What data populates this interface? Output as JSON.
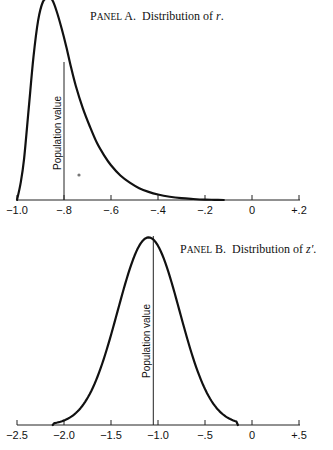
{
  "chart_data": [
    {
      "type": "line",
      "title_prefix": "Panel A.",
      "title_prefix_caps": "PANEL",
      "title_prefix_rest": " A.",
      "title_text": "Distribution of ",
      "title_var": "r",
      "title_suffix": ".",
      "xlabel": "",
      "ylabel": "",
      "xlim": [
        -1.0,
        0.2
      ],
      "ylim": [
        0,
        0.98
      ],
      "grid": false,
      "xticks": [
        -1.0,
        -0.8,
        -0.6,
        -0.4,
        -0.2,
        0,
        0.2
      ],
      "xtick_labels": [
        "−1.0",
        "−.8",
        "−.6",
        "−.4",
        "−.2",
        "0",
        "+.2"
      ],
      "population_value": -0.8,
      "population_label": "Population value",
      "series": [
        {
          "name": "sampling distribution of r",
          "x": [
            -1.0,
            -0.985,
            -0.97,
            -0.95,
            -0.93,
            -0.91,
            -0.89,
            -0.87,
            -0.85,
            -0.83,
            -0.81,
            -0.79,
            -0.77,
            -0.75,
            -0.72,
            -0.69,
            -0.66,
            -0.63,
            -0.6,
            -0.56,
            -0.52,
            -0.48,
            -0.44,
            -0.4,
            -0.35,
            -0.3,
            -0.25,
            -0.2,
            -0.16,
            -0.12
          ],
          "y": [
            0.0,
            0.08,
            0.2,
            0.45,
            0.7,
            0.88,
            0.97,
            1.0,
            0.98,
            0.92,
            0.84,
            0.75,
            0.65,
            0.56,
            0.45,
            0.36,
            0.28,
            0.22,
            0.17,
            0.12,
            0.085,
            0.058,
            0.04,
            0.027,
            0.016,
            0.009,
            0.005,
            0.002,
            0.001,
            0.0
          ]
        }
      ]
    },
    {
      "type": "line",
      "title_prefix_caps": "PANEL",
      "title_prefix_rest": " B.",
      "title_text": "Distribution of ",
      "title_var": "z′",
      "title_suffix": ".",
      "xlabel": "",
      "ylabel": "",
      "xlim": [
        -2.5,
        0.5
      ],
      "ylim": [
        0,
        1.05
      ],
      "grid": false,
      "xticks": [
        -2.5,
        -2.0,
        -1.5,
        -1.0,
        -0.5,
        0,
        0.5
      ],
      "xtick_labels": [
        "−2.5",
        "−2.0",
        "−1.5",
        "−1.0",
        "−.5",
        "0",
        "+.5"
      ],
      "population_value": -1.05,
      "population_label": "Population value",
      "series": [
        {
          "name": "sampling distribution of z′",
          "mean": -1.1,
          "sd": 0.33,
          "x_range": [
            -2.12,
            -0.15
          ]
        }
      ]
    }
  ]
}
